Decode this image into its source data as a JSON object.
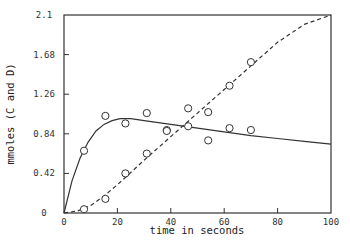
{
  "chart_data": {
    "type": "scatter",
    "title": "",
    "xlabel": "time in seconds",
    "ylabel": "mmoles (C and D)",
    "xlim": [
      0,
      100
    ],
    "ylim": [
      0,
      2.1
    ],
    "xticks": [
      "0",
      "20",
      "40",
      "60",
      "80",
      "100"
    ],
    "yticks": [
      "0",
      "0.42",
      "0.84",
      "1.26",
      "1.68",
      "2.1"
    ],
    "grid": false,
    "legend": null,
    "series": [
      {
        "name": "C",
        "style": "solid fitted curve with open circles",
        "points": [
          {
            "x": 7.5,
            "y": 0.66
          },
          {
            "x": 15.5,
            "y": 1.03
          },
          {
            "x": 23,
            "y": 0.95
          },
          {
            "x": 31,
            "y": 1.06
          },
          {
            "x": 38.5,
            "y": 0.88
          },
          {
            "x": 46.5,
            "y": 1.11
          },
          {
            "x": 46.5,
            "y": 0.92
          },
          {
            "x": 54,
            "y": 1.07
          },
          {
            "x": 62,
            "y": 0.9
          },
          {
            "x": 70,
            "y": 0.88
          }
        ],
        "curve": [
          [
            0,
            0
          ],
          [
            3,
            0.34
          ],
          [
            6,
            0.58
          ],
          [
            9,
            0.75
          ],
          [
            12,
            0.87
          ],
          [
            15,
            0.94
          ],
          [
            18,
            0.98
          ],
          [
            21,
            1.0
          ],
          [
            25,
            1.0
          ],
          [
            30,
            0.98
          ],
          [
            40,
            0.94
          ],
          [
            50,
            0.9
          ],
          [
            60,
            0.86
          ],
          [
            70,
            0.82
          ],
          [
            80,
            0.79
          ],
          [
            90,
            0.76
          ],
          [
            100,
            0.73
          ]
        ]
      },
      {
        "name": "D",
        "style": "dashed fitted curve with open circles",
        "points": [
          {
            "x": 7.5,
            "y": 0.04
          },
          {
            "x": 15.5,
            "y": 0.15
          },
          {
            "x": 23,
            "y": 0.42
          },
          {
            "x": 31,
            "y": 0.63
          },
          {
            "x": 38.5,
            "y": 0.87
          },
          {
            "x": 54,
            "y": 0.77
          },
          {
            "x": 62,
            "y": 1.35
          },
          {
            "x": 70,
            "y": 1.6
          }
        ],
        "curve": [
          [
            0,
            0
          ],
          [
            5,
            0.02
          ],
          [
            10,
            0.08
          ],
          [
            15,
            0.18
          ],
          [
            20,
            0.3
          ],
          [
            25,
            0.43
          ],
          [
            30,
            0.56
          ],
          [
            40,
            0.81
          ],
          [
            50,
            1.06
          ],
          [
            60,
            1.31
          ],
          [
            70,
            1.56
          ],
          [
            80,
            1.81
          ],
          [
            90,
            2.0
          ],
          [
            100,
            2.1
          ]
        ]
      }
    ]
  }
}
